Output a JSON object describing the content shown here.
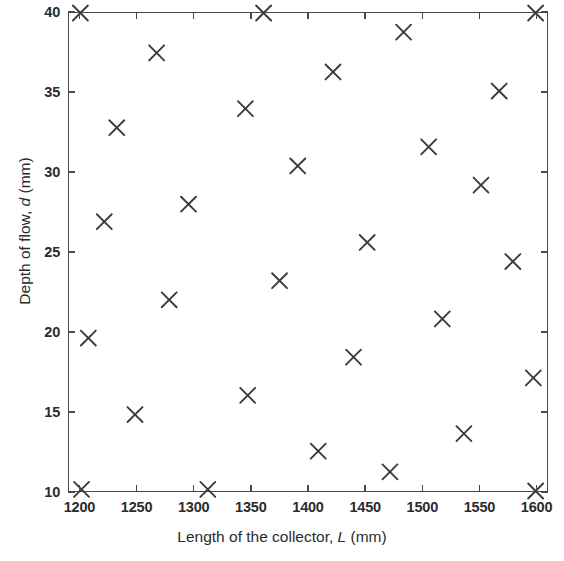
{
  "chart_data": {
    "type": "scatter",
    "title": "",
    "xlabel": "Length of the collector,  L (mm)",
    "ylabel": "Depth of flow,  d (mm)",
    "xlabel_text": "Length of the collector,",
    "xlabel_var": "L",
    "xlabel_unit": "(mm)",
    "ylabel_text": "Depth of flow,",
    "ylabel_var": "d",
    "ylabel_unit": "(mm)",
    "xlim": [
      1190,
      1610
    ],
    "ylim": [
      10,
      40
    ],
    "xticks": [
      1200,
      1250,
      1300,
      1350,
      1400,
      1450,
      1500,
      1550,
      1600
    ],
    "yticks": [
      10,
      15,
      20,
      25,
      30,
      35,
      40
    ],
    "xtick_labels": [
      "1200",
      "1250",
      "1300",
      "1350",
      "1400",
      "1450",
      "1500",
      "1550",
      "1600"
    ],
    "ytick_labels": [
      "10",
      "15",
      "20",
      "25",
      "30",
      "35",
      "40"
    ],
    "grid": false,
    "legend": null,
    "marker": "x",
    "marker_color": "#3a3a3a",
    "series": [
      {
        "name": "observations",
        "points": [
          {
            "x": 1200,
            "y": 40.0
          },
          {
            "x": 1207,
            "y": 19.6
          },
          {
            "x": 1201,
            "y": 10.1
          },
          {
            "x": 1221,
            "y": 26.9
          },
          {
            "x": 1232,
            "y": 32.8
          },
          {
            "x": 1248,
            "y": 14.8
          },
          {
            "x": 1267,
            "y": 37.5
          },
          {
            "x": 1278,
            "y": 22.0
          },
          {
            "x": 1295,
            "y": 28.0
          },
          {
            "x": 1312,
            "y": 10.1
          },
          {
            "x": 1345,
            "y": 34.0
          },
          {
            "x": 1347,
            "y": 16.0
          },
          {
            "x": 1361,
            "y": 40.0
          },
          {
            "x": 1375,
            "y": 23.2
          },
          {
            "x": 1391,
            "y": 30.4
          },
          {
            "x": 1409,
            "y": 12.5
          },
          {
            "x": 1422,
            "y": 36.3
          },
          {
            "x": 1440,
            "y": 18.4
          },
          {
            "x": 1452,
            "y": 25.6
          },
          {
            "x": 1472,
            "y": 11.2
          },
          {
            "x": 1484,
            "y": 38.8
          },
          {
            "x": 1506,
            "y": 31.6
          },
          {
            "x": 1518,
            "y": 20.8
          },
          {
            "x": 1537,
            "y": 13.6
          },
          {
            "x": 1552,
            "y": 29.2
          },
          {
            "x": 1568,
            "y": 35.1
          },
          {
            "x": 1580,
            "y": 24.4
          },
          {
            "x": 1598,
            "y": 17.1
          },
          {
            "x": 1600,
            "y": 40.0
          },
          {
            "x": 1600,
            "y": 10.0
          }
        ]
      }
    ]
  }
}
